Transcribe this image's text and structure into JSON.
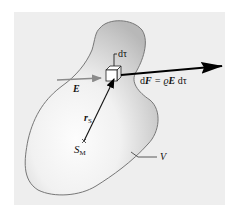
{
  "figure": {
    "colors": {
      "panel": "#eeeeee",
      "blob_outline": "#777777",
      "blob_fill_dark": "#bdbdbd",
      "blob_fill_light": "#fbfbfb",
      "arrow_E": "#8a8a8a",
      "arrow_force": "#000000",
      "arrow_r": "#111111"
    },
    "labels": {
      "volume_element": "dτ",
      "field": "E",
      "force_lhs_d": "d",
      "force_lhs_F": "F",
      "force_eq": " = ϱ",
      "force_E": "E",
      "force_dtau": " dτ",
      "position_r": "r",
      "position_r_sub": "S",
      "center_S": "S",
      "center_S_sub": "M",
      "volume": "V"
    }
  }
}
